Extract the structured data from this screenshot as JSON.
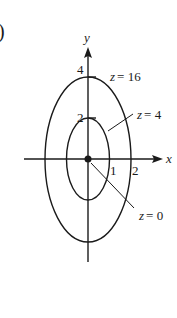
{
  "figure": {
    "panel_marker": ")",
    "axes": {
      "x_label": "x",
      "y_label": "y"
    },
    "ticks": {
      "x": [
        "1",
        "2"
      ],
      "y": [
        "2",
        "4"
      ]
    },
    "level_curves": [
      {
        "label": "z = 16",
        "shape": "ellipse",
        "x_semi_axis": 2,
        "y_semi_axis": 4
      },
      {
        "label": "z = 4",
        "shape": "ellipse",
        "x_semi_axis": 1,
        "y_semi_axis": 2
      },
      {
        "label": "z = 0",
        "shape": "point",
        "at": [
          0,
          0
        ]
      }
    ],
    "colors": {
      "ink": "#1a1a1a",
      "background": "#ffffff"
    }
  }
}
